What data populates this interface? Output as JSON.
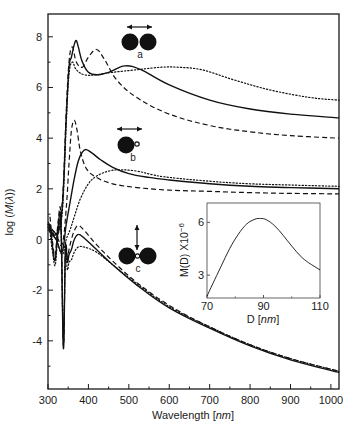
{
  "chart_data": [
    {
      "type": "line",
      "title": "",
      "xlabel": "Wavelength [nm]",
      "xlabel_parts": {
        "prefix": "Wavelength [",
        "unit": "nm",
        "suffix": "]"
      },
      "ylabel": "log (M(λ))",
      "xlim": [
        300,
        1020
      ],
      "ylim": [
        -5.9,
        8.9
      ],
      "xticks": [
        300,
        400,
        500,
        600,
        700,
        800,
        900,
        1000
      ],
      "xtick_labels": [
        "300",
        "400",
        "500",
        "600",
        "700",
        "800",
        "900",
        "1000"
      ],
      "yticks": [
        -4,
        -2,
        0,
        2,
        4,
        6,
        8
      ],
      "ytick_labels": [
        "-4",
        "-2",
        "0",
        "2",
        "4",
        "6",
        "8"
      ],
      "grid": false,
      "legend": "none",
      "annotations": [
        {
          "label": "a",
          "description": "dimer of two touching spheres, polarization arrow horizontal",
          "x": 370,
          "y": 7.7
        },
        {
          "label": "b",
          "description": "large sphere with small sphere, polarization arrow horizontal",
          "x": 370,
          "y": 4.3
        },
        {
          "label": "c",
          "description": "two spheres with small sphere between, polarization arrow vertical",
          "x": 370,
          "y": -0.3
        }
      ],
      "series": [
        {
          "name": "a-solid",
          "group": "a",
          "style": "solid",
          "x": [
            300,
            320,
            335,
            345,
            352,
            358,
            365,
            370,
            375,
            385,
            400,
            420,
            450,
            490,
            530,
            600,
            700,
            800,
            900,
            1020
          ],
          "y": [
            0.5,
            0.2,
            1.2,
            4.8,
            6.8,
            7.2,
            7.7,
            7.85,
            7.6,
            7.0,
            6.6,
            6.5,
            6.6,
            6.85,
            6.7,
            6.1,
            5.5,
            5.15,
            4.95,
            4.8
          ]
        },
        {
          "name": "a-dashed",
          "group": "a",
          "style": "dashed",
          "x": [
            300,
            320,
            335,
            345,
            352,
            360,
            370,
            385,
            400,
            420,
            440,
            470,
            520,
            600,
            700,
            800,
            900,
            1020
          ],
          "y": [
            0.7,
            0.3,
            1.4,
            5.0,
            7.0,
            7.6,
            7.0,
            6.8,
            7.2,
            7.5,
            7.1,
            6.3,
            5.6,
            4.95,
            4.5,
            4.25,
            4.1,
            4.0
          ]
        },
        {
          "name": "a-dotted",
          "group": "a",
          "style": "dotted",
          "x": [
            300,
            320,
            335,
            345,
            352,
            360,
            370,
            390,
            420,
            460,
            520,
            580,
            620,
            680,
            760,
            850,
            950,
            1020
          ],
          "y": [
            0.6,
            0.2,
            1.0,
            4.5,
            6.5,
            7.0,
            6.7,
            6.5,
            6.5,
            6.6,
            6.7,
            6.8,
            6.8,
            6.7,
            6.3,
            5.9,
            5.6,
            5.5
          ]
        },
        {
          "name": "b-solid",
          "group": "b",
          "style": "solid",
          "x": [
            300,
            320,
            335,
            345,
            355,
            365,
            375,
            385,
            395,
            410,
            430,
            460,
            500,
            550,
            600,
            700,
            800,
            900,
            1020
          ],
          "y": [
            0.4,
            0.0,
            -0.5,
            0.6,
            1.5,
            2.4,
            3.1,
            3.45,
            3.55,
            3.4,
            3.15,
            2.85,
            2.6,
            2.45,
            2.35,
            2.2,
            2.1,
            2.05,
            2.0
          ]
        },
        {
          "name": "b-dashed",
          "group": "b",
          "style": "dashed",
          "x": [
            300,
            320,
            335,
            345,
            352,
            358,
            365,
            372,
            380,
            395,
            420,
            460,
            520,
            600,
            700,
            800,
            900,
            1020
          ],
          "y": [
            0.6,
            0.2,
            -0.2,
            1.2,
            3.0,
            4.3,
            4.7,
            4.3,
            3.5,
            2.8,
            2.45,
            2.2,
            2.05,
            1.95,
            1.9,
            1.85,
            1.82,
            1.8
          ]
        },
        {
          "name": "b-dotted",
          "group": "b",
          "style": "dotted",
          "x": [
            300,
            320,
            335,
            345,
            355,
            365,
            380,
            400,
            420,
            450,
            480,
            520,
            560,
            600,
            700,
            800,
            900,
            1020
          ],
          "y": [
            0.5,
            0.0,
            -0.6,
            0.0,
            0.4,
            0.9,
            1.6,
            2.2,
            2.5,
            2.7,
            2.75,
            2.7,
            2.55,
            2.45,
            2.3,
            2.2,
            2.15,
            2.1
          ]
        },
        {
          "name": "c-solid",
          "group": "c",
          "style": "solid",
          "x": [
            305,
            312,
            318,
            325,
            332,
            338,
            343,
            348,
            352,
            358,
            365,
            375,
            390,
            420,
            460,
            520,
            600,
            700,
            800,
            900,
            1020
          ],
          "y": [
            0.6,
            -0.4,
            -0.8,
            0.5,
            0.7,
            -4.3,
            -0.4,
            -0.9,
            -0.6,
            -0.4,
            0.0,
            0.2,
            0.05,
            -0.4,
            -1.0,
            -1.8,
            -2.7,
            -3.5,
            -4.2,
            -4.75,
            -5.25
          ]
        },
        {
          "name": "c-dashed",
          "group": "c",
          "style": "dashed",
          "x": [
            305,
            312,
            318,
            325,
            332,
            338,
            343,
            348,
            352,
            358,
            365,
            375,
            390,
            420,
            460,
            520,
            600,
            700,
            800,
            900,
            1020
          ],
          "y": [
            0.9,
            -0.2,
            -0.6,
            0.7,
            0.9,
            -4.2,
            -0.3,
            -0.7,
            -0.4,
            0.0,
            0.35,
            0.55,
            0.35,
            -0.2,
            -0.85,
            -1.7,
            -2.6,
            -3.45,
            -4.15,
            -4.7,
            -5.2
          ]
        },
        {
          "name": "c-dotted",
          "group": "c",
          "style": "dotted",
          "x": [
            305,
            312,
            318,
            325,
            332,
            338,
            343,
            348,
            352,
            358,
            365,
            375,
            390,
            420,
            460,
            520,
            600,
            700,
            800,
            900,
            1020
          ],
          "y": [
            0.3,
            -0.6,
            -1.0,
            0.2,
            0.5,
            -4.0,
            -0.6,
            -1.2,
            -0.9,
            -0.8,
            -0.5,
            -0.3,
            -0.3,
            -0.5,
            -1.0,
            -1.75,
            -2.65,
            -3.45,
            -4.15,
            -4.7,
            -5.2
          ]
        }
      ]
    },
    {
      "type": "line",
      "title": "",
      "inset": true,
      "xlabel": "D [nm]",
      "xlabel_parts": {
        "prefix": "D [",
        "unit": "nm",
        "suffix": "]"
      },
      "ylabel": "M(D) X10−6",
      "ylabel_parts": {
        "base": "M(D) X10",
        "exp": "−6"
      },
      "xlim": [
        70,
        110
      ],
      "ylim": [
        1.7,
        7.1
      ],
      "xticks": [
        70,
        90,
        110
      ],
      "xtick_labels": [
        "70",
        "90",
        "110"
      ],
      "yticks": [
        3,
        6
      ],
      "ytick_labels": [
        "3",
        "6"
      ],
      "grid": false,
      "series": [
        {
          "name": "M(D)",
          "style": "solid",
          "x": [
            70,
            72,
            75,
            78,
            81,
            84,
            87,
            89,
            91,
            94,
            97,
            100,
            103,
            106,
            110
          ],
          "y": [
            1.8,
            2.5,
            3.5,
            4.5,
            5.3,
            5.9,
            6.18,
            6.22,
            6.15,
            5.8,
            5.25,
            4.65,
            4.1,
            3.7,
            3.3
          ]
        }
      ]
    }
  ],
  "labels": {
    "a": "a",
    "b": "b",
    "c": "c"
  }
}
